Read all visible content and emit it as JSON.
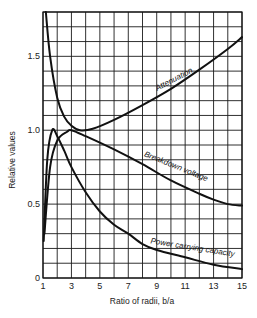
{
  "chart_data": {
    "type": "line",
    "title": "",
    "xlabel": "Ratio of radii, b/a",
    "ylabel": "Relative values",
    "xlim": [
      1,
      15
    ],
    "ylim": [
      0,
      1.8
    ],
    "grid": true,
    "x_ticks": [
      1,
      3,
      5,
      7,
      9,
      11,
      13,
      15
    ],
    "x_tick_labels": [
      "1",
      "3",
      "5",
      "7",
      "9",
      "11",
      "13",
      "15"
    ],
    "y_ticks": [
      0,
      0.5,
      1.0,
      1.5
    ],
    "y_tick_labels": [
      "0",
      "0.5",
      "1.0",
      "1.5"
    ],
    "x_grid_step": 1,
    "y_grid_step": 0.1,
    "series": [
      {
        "name": "Attenuation",
        "x": [
          1.2,
          1.5,
          2,
          2.5,
          3,
          3.6,
          4.5,
          6,
          8,
          10,
          12,
          14,
          15
        ],
        "y": [
          1.8,
          1.5,
          1.22,
          1.09,
          1.03,
          1.0,
          1.01,
          1.07,
          1.17,
          1.28,
          1.41,
          1.55,
          1.63
        ]
      },
      {
        "name": "Breakdown voltage",
        "x": [
          1.1,
          1.5,
          2,
          2.7,
          3,
          4,
          6,
          8,
          10,
          12,
          13,
          14,
          15
        ],
        "y": [
          0.3,
          0.75,
          0.93,
          0.99,
          1.0,
          0.96,
          0.87,
          0.77,
          0.66,
          0.57,
          0.53,
          0.5,
          0.49
        ]
      },
      {
        "name": "Power carrying capacity",
        "x": [
          1.05,
          1.3,
          1.65,
          2,
          2.5,
          3,
          4,
          5,
          6,
          7,
          8,
          9,
          11,
          13,
          15
        ],
        "y": [
          0.25,
          0.8,
          1.0,
          0.96,
          0.86,
          0.75,
          0.58,
          0.45,
          0.36,
          0.3,
          0.23,
          0.19,
          0.14,
          0.09,
          0.06
        ]
      }
    ],
    "annotations": [
      {
        "text": "Attenuation",
        "x": 10.3,
        "y": 1.33,
        "rotate": -28
      },
      {
        "text": "Breakdown voltage",
        "x": 10.3,
        "y": 0.74,
        "rotate": 22
      },
      {
        "text": "Power carrying capacity",
        "x": 11.5,
        "y": 0.19,
        "rotate": 9
      }
    ]
  }
}
